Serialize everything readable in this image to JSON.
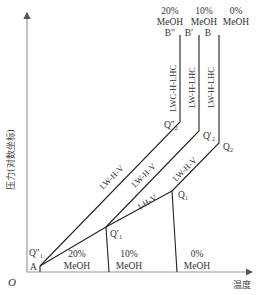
{
  "diagram": {
    "type": "phase-diagram",
    "axes": {
      "origin_label": "O",
      "x_label": "温度",
      "y_label": "压力(对数坐标)"
    },
    "top_labels": [
      {
        "pct": "20%",
        "name": "MeOH",
        "point": "B″"
      },
      {
        "pct": "10%",
        "name": "MeOH",
        "point": "B′"
      },
      {
        "pct": "0%",
        "name": "MeOH",
        "point": "B"
      }
    ],
    "bottom_labels": [
      {
        "pct": "20%",
        "name": "MeOH"
      },
      {
        "pct": "10%",
        "name": "MeOH"
      },
      {
        "pct": "0%",
        "name": "MeOH"
      }
    ],
    "points": {
      "A": "A",
      "Q1pp": "Q″",
      "Q1p": "Q′",
      "Q1": "Q",
      "Q2pp": "Q″",
      "Q2p": "Q′",
      "Q2": "Q"
    },
    "point_subs": {
      "Q1": "1",
      "Q2": "2"
    },
    "curve_labels": {
      "vertical_20": "LWC-H-LHC",
      "vertical_10": "LW-H-LHC",
      "vertical_0": "LW-H-LHC",
      "diag_20": "LW-H-V",
      "diag_10": "LW-H-V",
      "diag_0": "LW-H-V",
      "ice": "I-H-V"
    }
  }
}
